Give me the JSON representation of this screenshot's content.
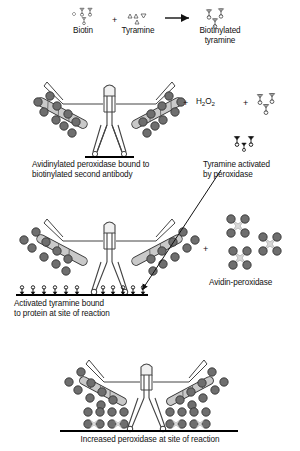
{
  "diagram": {
    "title_caption": "Catalyzed signal amplification (tyramide) reaction sequence",
    "type": "biochemistry-schematic"
  },
  "reaction_row": {
    "reagent1_label": "Biotin",
    "plus1": "+",
    "reagent2_label": "Tyramine",
    "arrow": "→",
    "product_label": "Biotinylated\ntyramine",
    "reagent1_icon": "biotin-cluster-icon",
    "reagent2_icon": "tyramine-triangle-cluster-icon",
    "product_icon": "biotinylated-tyramine-icon"
  },
  "panel1": {
    "caption": "Avidinylated peroxidase bound to\nbiotinylated second antibody",
    "plus_a": "+",
    "h2o2_label": "H",
    "h2o2_sub1": "2",
    "h2o2_mid": "O",
    "h2o2_sub2": "2",
    "h2o2_text": "H2O2",
    "plus_b": "+",
    "side_icon": "biotinylated-tyramine-icon",
    "antibody_icon": "y-shaped-antibody-icon",
    "peroxidase_icon": "peroxidase-bead-icon"
  },
  "panel2": {
    "caption_right": "Tyramine activated\nby peroxidase",
    "activated_icon": "activated-tyramine-icon"
  },
  "panel3": {
    "caption": "Activated tyramine bound\nto protein at site of reaction",
    "plus": "+",
    "right_label": "Avidin-peroxidase",
    "avidin_icon": "avidin-peroxidase-cross-icon",
    "arrow_icon": "diagonal-arrow-icon",
    "bound_tyramine_count_left": 6,
    "bound_tyramine_count_right": 5
  },
  "panel4": {
    "caption": "Increased peroxidase at site of reaction",
    "antibody_icon": "y-shaped-antibody-icon",
    "peroxidase_icon": "peroxidase-bead-icon"
  },
  "colors": {
    "bead_fill": "#6e6e6e",
    "bead_stroke": "#2b2b2b",
    "arm_fill": "#c9c9c9",
    "arm_stroke": "#333333",
    "line": "#000000",
    "cross_fill": "#d9d9d9",
    "background": "#ffffff"
  }
}
